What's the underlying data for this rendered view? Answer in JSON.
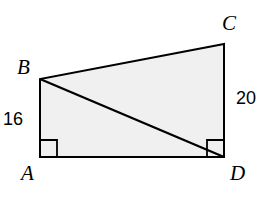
{
  "figure": {
    "type": "geometry-diagram",
    "shape": "right-trapezoid-with-diagonal",
    "background_color": "#ffffff",
    "fill_color": "#f0f0f0",
    "stroke_color": "#000000",
    "stroke_width": 2,
    "canvas": {
      "width": 269,
      "height": 199
    },
    "vertices": [
      {
        "name": "A",
        "x": 40,
        "y": 157
      },
      {
        "name": "B",
        "x": 40,
        "y": 79
      },
      {
        "name": "C",
        "x": 224,
        "y": 44
      },
      {
        "name": "D",
        "x": 224,
        "y": 157
      }
    ],
    "outline_path": "M 40 157 L 40 79 L 224 44 L 224 157 Z",
    "diagonal": {
      "name": "BD",
      "from": "B",
      "to": "D",
      "path": "M 40 79 L 224 157"
    },
    "right_angles": [
      {
        "at": "A",
        "size": 17,
        "path": "M 40 140 L 57 140 L 57 157"
      },
      {
        "at": "D",
        "size": 17,
        "path": "M 207 157 L 207 140 L 224 140"
      }
    ],
    "vertex_labels": [
      {
        "id": "A",
        "text": "A"
      },
      {
        "id": "B",
        "text": "B"
      },
      {
        "id": "C",
        "text": "C"
      },
      {
        "id": "D",
        "text": "D"
      }
    ],
    "side_labels": [
      {
        "id": "16",
        "text": "16",
        "side": "AB"
      },
      {
        "id": "20",
        "text": "20",
        "side": "CD"
      }
    ]
  }
}
